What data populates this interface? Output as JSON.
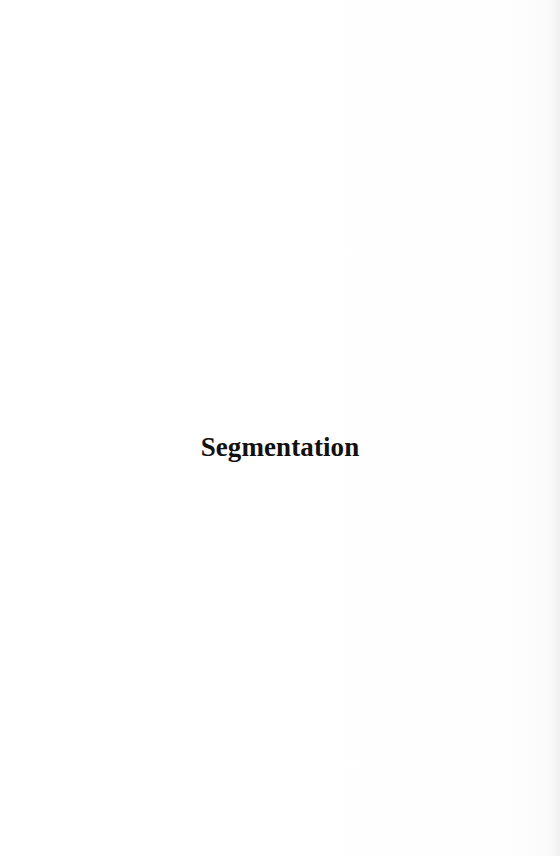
{
  "page": {
    "section_title": "Segmentation",
    "colors": {
      "background": "#fefefe",
      "text": "#111111",
      "edge_shadow": "#ebebeb"
    }
  }
}
